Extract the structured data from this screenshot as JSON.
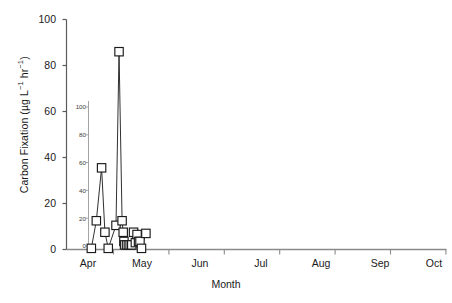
{
  "figure": {
    "kind": "scientific-line-chart",
    "background": "#ffffff",
    "ink": "#1a1a1a"
  },
  "axis": {
    "y_title_plain": "Carbon Fixation (µg L⁻¹ hr⁻¹)",
    "x_title": "Month",
    "y_ticks": [
      "100",
      "80",
      "60",
      "40",
      "20",
      "0"
    ],
    "y_ticks_inner": [
      "100",
      "80",
      "60",
      "40",
      "20",
      "0"
    ],
    "x_ticks": [
      "Apr",
      "May",
      "Jun",
      "Jul",
      "Aug",
      "Sep",
      "Oct"
    ]
  },
  "chart_data": {
    "type": "line",
    "title": "",
    "subtitle": "",
    "xlabel": "Month",
    "ylabel": "Carbon Fixation (µg L⁻¹ hr⁻¹)",
    "ylim": [
      0,
      100
    ],
    "yticks": [
      0,
      20,
      40,
      60,
      80,
      100
    ],
    "xlim": [
      "Apr",
      "Oct"
    ],
    "xticks": [
      "Apr",
      "May",
      "Jun",
      "Jul",
      "Aug",
      "Sep",
      "Oct"
    ],
    "grid": false,
    "legend": null,
    "marker": "open-square",
    "line_color": "#1a1a1a",
    "marker_facecolor": "#ffffff",
    "marker_edgecolor": "#1a1a1a",
    "series": [
      {
        "name": "Carbon fixation",
        "points": [
          {
            "x": 0.1,
            "y": 0.5
          },
          {
            "x": 0.19,
            "y": 12.5
          },
          {
            "x": 0.285,
            "y": 35.5
          },
          {
            "x": 0.345,
            "y": 7.5
          },
          {
            "x": 0.405,
            "y": 0.5
          },
          {
            "x": 0.545,
            "y": 10.5
          },
          {
            "x": 0.6,
            "y": 86.0
          },
          {
            "x": 0.655,
            "y": 12.5
          },
          {
            "x": 0.675,
            "y": 7.5
          },
          {
            "x": 0.688,
            "y": 3.5
          },
          {
            "x": 0.7,
            "y": 2.0
          },
          {
            "x": 0.735,
            "y": 2.0
          },
          {
            "x": 0.768,
            "y": 2.0
          },
          {
            "x": 0.8,
            "y": 2.0
          },
          {
            "x": 0.83,
            "y": 2.0
          },
          {
            "x": 0.862,
            "y": 7.5
          },
          {
            "x": 0.895,
            "y": 3.0
          },
          {
            "x": 0.925,
            "y": 6.5
          },
          {
            "x": 0.952,
            "y": 3.5
          },
          {
            "x": 0.978,
            "y": 3.5
          },
          {
            "x": 1.005,
            "y": 0.5
          },
          {
            "x": 1.085,
            "y": 7.0
          }
        ]
      }
    ],
    "annotations": [
      {
        "text": "inner duplicate y-axis tick labels (100/80/60/40/20/0) overprinted inside the plot area"
      }
    ]
  },
  "caption": {
    "ghost_text": ""
  }
}
